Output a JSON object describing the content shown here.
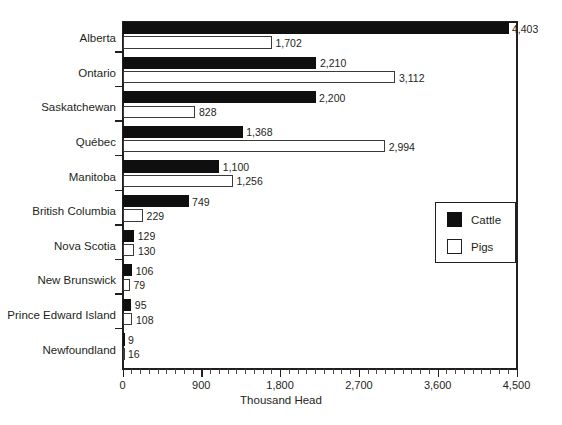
{
  "chart_data": {
    "type": "bar",
    "orientation": "horizontal",
    "title": "",
    "xlabel": "Thousand Head",
    "ylabel": "",
    "xlim": [
      0,
      4500
    ],
    "xticks": [
      0,
      900,
      1800,
      2700,
      3600,
      4500
    ],
    "xtick_labels": [
      "0",
      "900",
      "1,800",
      "2,700",
      "3,600",
      "4,500"
    ],
    "minor_tick_step": 100,
    "grid": false,
    "legend_position": "center-right",
    "categories": [
      "Alberta",
      "Ontario",
      "Saskatchewan",
      "Québec",
      "Manitoba",
      "British Columbia",
      "Nova Scotia",
      "New Brunswick",
      "Prince Edward Island",
      "Newfoundland"
    ],
    "series": [
      {
        "name": "Cattle",
        "color": "#100f0f",
        "values": [
          4403,
          2210,
          2200,
          1368,
          1100,
          749,
          129,
          106,
          95,
          9
        ],
        "value_labels": [
          "4,403",
          "2,210",
          "2,200",
          "1,368",
          "1,100",
          "749",
          "129",
          "106",
          "95",
          "9"
        ]
      },
      {
        "name": "Pigs",
        "color": "#ffffff",
        "values": [
          1702,
          3112,
          828,
          2994,
          1256,
          229,
          130,
          79,
          108,
          16
        ],
        "value_labels": [
          "1,702",
          "3,112",
          "828",
          "2,994",
          "1,256",
          "229",
          "130",
          "79",
          "108",
          "16"
        ]
      }
    ]
  },
  "legend": {
    "items": [
      {
        "label": "Cattle",
        "style": "filled"
      },
      {
        "label": "Pigs",
        "style": "outline"
      }
    ]
  }
}
